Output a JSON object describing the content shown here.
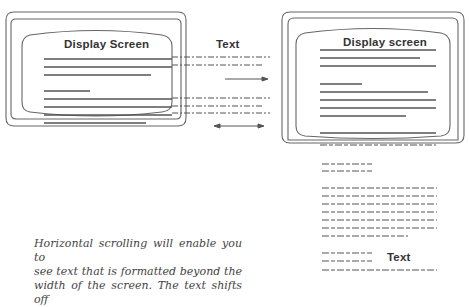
{
  "left_monitor": {
    "title": "Display Screen"
  },
  "right_monitor": {
    "title": "Display screen"
  },
  "labels": {
    "text_top": "Text",
    "text_bottom": "Text"
  },
  "caption": {
    "lines": [
      "Horizontal scrolling will enable you to",
      "see text that is formatted beyond the",
      "width of the screen. The text shifts off"
    ]
  },
  "arrows": {
    "top": "right-arrow",
    "bottom": "double-arrow"
  }
}
